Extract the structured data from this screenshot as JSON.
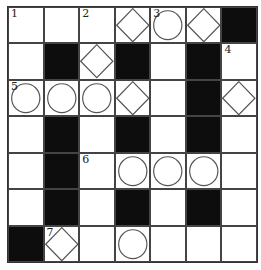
{
  "puzzle": {
    "rows": 7,
    "cols": 7,
    "colors": {
      "black": "#0d0d0d",
      "white": "#ffffff",
      "line": "#444444"
    },
    "legend": {
      "W": "white",
      "B": "black",
      "C": "circle",
      "D": "diamond"
    },
    "grid": [
      [
        {
          "t": "W",
          "n": "1"
        },
        {
          "t": "W"
        },
        {
          "t": "W",
          "n": "2"
        },
        {
          "t": "D"
        },
        {
          "t": "C",
          "n": "3"
        },
        {
          "t": "D"
        },
        {
          "t": "B"
        }
      ],
      [
        {
          "t": "W"
        },
        {
          "t": "B"
        },
        {
          "t": "D"
        },
        {
          "t": "B"
        },
        {
          "t": "W"
        },
        {
          "t": "B"
        },
        {
          "t": "W",
          "n": "4"
        }
      ],
      [
        {
          "t": "C",
          "n": "5"
        },
        {
          "t": "C"
        },
        {
          "t": "C"
        },
        {
          "t": "D"
        },
        {
          "t": "W"
        },
        {
          "t": "B"
        },
        {
          "t": "D"
        }
      ],
      [
        {
          "t": "W"
        },
        {
          "t": "B"
        },
        {
          "t": "W"
        },
        {
          "t": "B"
        },
        {
          "t": "W"
        },
        {
          "t": "B"
        },
        {
          "t": "W"
        }
      ],
      [
        {
          "t": "W"
        },
        {
          "t": "B"
        },
        {
          "t": "W",
          "n": "6"
        },
        {
          "t": "C"
        },
        {
          "t": "C"
        },
        {
          "t": "C"
        },
        {
          "t": "W"
        }
      ],
      [
        {
          "t": "W"
        },
        {
          "t": "B"
        },
        {
          "t": "W"
        },
        {
          "t": "B"
        },
        {
          "t": "W"
        },
        {
          "t": "B"
        },
        {
          "t": "W"
        }
      ],
      [
        {
          "t": "B"
        },
        {
          "t": "D",
          "n": "7"
        },
        {
          "t": "W"
        },
        {
          "t": "C"
        },
        {
          "t": "W"
        },
        {
          "t": "W"
        },
        {
          "t": "W"
        }
      ]
    ]
  }
}
